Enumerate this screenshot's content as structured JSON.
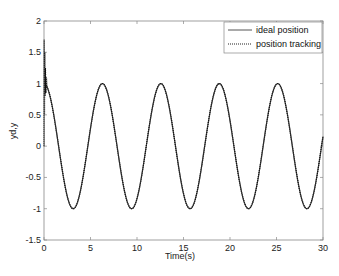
{
  "chart_data": {
    "type": "line",
    "title": "",
    "xlabel": "Time(s)",
    "ylabel": "yd,y",
    "xlim": [
      0,
      30
    ],
    "ylim": [
      -1.5,
      2
    ],
    "xticks": [
      0,
      5,
      10,
      15,
      20,
      25,
      30
    ],
    "yticks": [
      -1.5,
      -1,
      -0.5,
      0,
      0.5,
      1,
      1.5,
      2
    ],
    "xtick_labels": [
      "0",
      "5",
      "10",
      "15",
      "20",
      "25",
      "30"
    ],
    "ytick_labels": [
      "-1.5",
      "-1",
      "-0.5",
      "0",
      "0.5",
      "1",
      "1.5",
      "2"
    ],
    "grid": false,
    "legend_position": "upper right",
    "series": [
      {
        "name": "ideal position",
        "style": "solid",
        "color": "#333333",
        "function": "cos(t)",
        "x": [
          0,
          1.57,
          3.14,
          4.71,
          6.28,
          7.85,
          9.42,
          11.0,
          12.57,
          14.14,
          15.71,
          17.28,
          18.85,
          20.42,
          21.99,
          23.56,
          25.13,
          26.7,
          28.27,
          29.85,
          30
        ],
        "values": [
          1,
          0,
          -1,
          0,
          1,
          0,
          -1,
          0,
          1,
          0,
          -1,
          0,
          1,
          0,
          -1,
          0,
          1,
          0,
          -1,
          0,
          0.15
        ]
      },
      {
        "name": "position tracking",
        "style": "dotted",
        "color": "#111111",
        "note": "initial transient spike up to ~1.7 near t=0, then tracks cos(t)",
        "x": [
          0,
          0.05,
          0.1,
          0.2,
          0.3,
          1.57,
          3.14,
          4.71,
          6.28,
          7.85,
          9.42,
          11.0,
          12.57,
          14.14,
          15.71,
          17.28,
          18.85,
          20.42,
          21.99,
          23.56,
          25.13,
          26.7,
          28.27,
          29.85,
          30
        ],
        "values": [
          0,
          1.7,
          0.8,
          1.2,
          0.95,
          0,
          -1,
          0,
          1,
          0,
          -1,
          0,
          1,
          0,
          -1,
          0,
          1,
          0,
          -1,
          0,
          1,
          0,
          -1,
          0,
          0.15
        ]
      }
    ]
  },
  "legend": {
    "items": [
      {
        "label": "ideal position",
        "style": "solid"
      },
      {
        "label": "position tracking",
        "style": "dotted"
      }
    ]
  }
}
